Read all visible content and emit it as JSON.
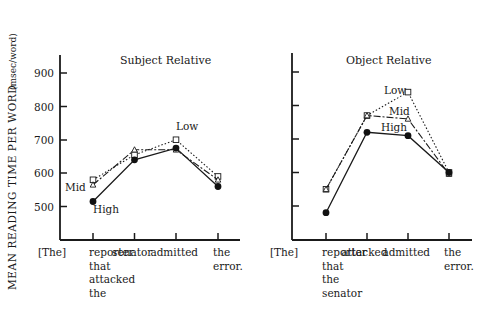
{
  "figure": {
    "y_axis_label": "MEAN  READING  TIME  PER  WORD",
    "y_axis_unit": "(msec/word)",
    "y_ticks": [
      "900",
      "800",
      "700",
      "600",
      "500"
    ]
  },
  "chart_data": [
    {
      "type": "line",
      "title": "Subject  Relative",
      "xlabel": "",
      "ylabel": "MEAN READING TIME PER WORD (msec/word)",
      "ylim": [
        400,
        950
      ],
      "y_ticks": [
        500,
        600,
        700,
        800,
        900
      ],
      "grid": false,
      "legend": "inline labels (Low, Mid, High)",
      "categories": [
        "[The] reporter that attacked the",
        "senator",
        "admitted",
        "the error."
      ],
      "x_tick_labels": [
        {
          "lead": "[The]",
          "lines": [
            "reporter",
            "that",
            "attacked",
            "the"
          ]
        },
        {
          "lines": [
            "senator"
          ]
        },
        {
          "lines": [
            "admitted"
          ]
        },
        {
          "lines": [
            "the",
            "error."
          ]
        }
      ],
      "series": [
        {
          "name": "Low",
          "marker": "open-square",
          "line": "dotted",
          "values": [
            580,
            655,
            700,
            590
          ]
        },
        {
          "name": "Mid",
          "marker": "open-triangle",
          "line": "dash-dot",
          "values": [
            565,
            670,
            670,
            580
          ]
        },
        {
          "name": "High",
          "marker": "filled-circle",
          "line": "solid",
          "values": [
            515,
            640,
            675,
            560
          ]
        }
      ]
    },
    {
      "type": "line",
      "title": "Object  Relative",
      "xlabel": "",
      "ylabel": "MEAN READING TIME PER WORD (msec/word)",
      "ylim": [
        400,
        950
      ],
      "y_ticks": [
        500,
        600,
        700,
        800,
        900
      ],
      "grid": false,
      "legend": "inline labels (Low, Mid, High)",
      "categories": [
        "[The] reporter that the senator",
        "attacked",
        "admitted",
        "the error."
      ],
      "x_tick_labels": [
        {
          "lead": "[The]",
          "lines": [
            "reporter",
            "that",
            "the",
            "senator"
          ]
        },
        {
          "lines": [
            "attacked"
          ]
        },
        {
          "lines": [
            "admitted"
          ]
        },
        {
          "lines": [
            "the",
            "error."
          ]
        }
      ],
      "series": [
        {
          "name": "Low",
          "marker": "open-square",
          "line": "dotted",
          "values": [
            550,
            770,
            840,
            600
          ]
        },
        {
          "name": "Mid",
          "marker": "open-triangle",
          "line": "dash-dot",
          "values": [
            550,
            770,
            760,
            595
          ]
        },
        {
          "name": "High",
          "marker": "filled-circle",
          "line": "solid",
          "values": [
            480,
            720,
            710,
            600
          ]
        }
      ]
    }
  ]
}
